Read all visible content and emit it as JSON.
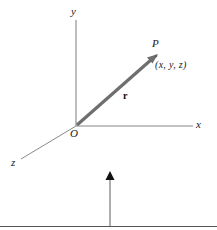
{
  "figure": {
    "background_color": "#ffffff",
    "axis_color": "#808080",
    "vector_color": "#6e6e6e",
    "label_color": "#1a1a1a",
    "rule_color": "#555555",
    "labels": {
      "y_axis": "y",
      "x_axis": "x",
      "z_axis": "z",
      "origin": "O",
      "point": "P",
      "coordinates": "(x, y, z)",
      "vector": "r"
    },
    "geometry": {
      "origin": [
        76,
        126
      ],
      "y_axis_tip": [
        76,
        20
      ],
      "x_axis_tip": [
        192,
        126
      ],
      "z_axis_tip": [
        22,
        158
      ],
      "point_p": [
        157,
        55
      ]
    },
    "bottom_marker": {
      "arrow_label": "up-arrow",
      "arrow_x": 110,
      "arrow_top_y": 172,
      "arrow_bottom_y": 226,
      "rule_y": 226
    }
  }
}
